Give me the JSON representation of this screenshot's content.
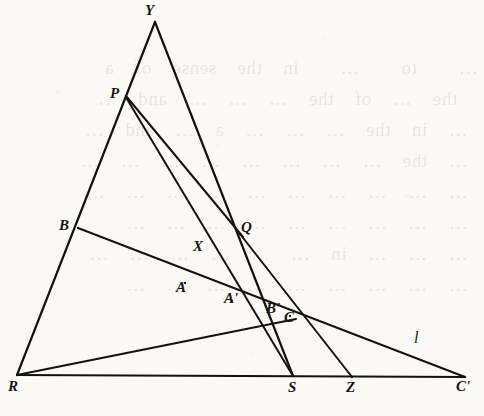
{
  "figure": {
    "ink_color": "#14120f",
    "paper_color": "#fbfaf7",
    "bleed_text": "…    to    …    in  the  sense  of  a\n  the  …  of  the  …  …  …  and  …\n …  in  the  …  …  …  a  …  and  …\n …  the  …  …  …  …  …  …  …  …\n …  …  …  …  …  …  …  …  …  …\n …  …  …  …  …  …  …  …  …\n …  …  …  in  …  …  …  …  …  …\n …  …  …  …  …  …  …  …  …",
    "points": {
      "Y": {
        "label": "Y",
        "x": 155,
        "y": 22
      },
      "P": {
        "label": "P",
        "x": 126,
        "y": 96
      },
      "B": {
        "label": "B",
        "x": 78,
        "y": 228
      },
      "Q": {
        "label": "Q",
        "x": 240,
        "y": 234
      },
      "X": {
        "label": "X",
        "x": 196,
        "y": 254
      },
      "A": {
        "label": "A",
        "x": 185,
        "y": 283
      },
      "Aprime": {
        "label": "A'",
        "x": 232,
        "y": 301
      },
      "Bprime": {
        "label": "B'",
        "x": 273,
        "y": 312
      },
      "C": {
        "label": "C",
        "x": 290,
        "y": 316
      },
      "R": {
        "label": "R",
        "x": 17,
        "y": 375
      },
      "S": {
        "label": "S",
        "x": 293,
        "y": 376
      },
      "Z": {
        "label": "Z",
        "x": 352,
        "y": 377
      },
      "Cprime": {
        "label": "C'",
        "x": 465,
        "y": 377
      },
      "l": {
        "label": "l",
        "x": 416,
        "y": 340
      }
    },
    "labels": [
      {
        "name": "label-Y",
        "text": "Y",
        "x": 145,
        "y": 2,
        "style": "italic"
      },
      {
        "name": "label-P",
        "text": "P",
        "x": 110,
        "y": 85,
        "style": "italic"
      },
      {
        "name": "label-B",
        "text": "B",
        "x": 59,
        "y": 217,
        "style": "italic"
      },
      {
        "name": "label-Q",
        "text": "Q",
        "x": 241,
        "y": 219,
        "style": "italic"
      },
      {
        "name": "label-X",
        "text": "X",
        "x": 193,
        "y": 238,
        "style": "italic"
      },
      {
        "name": "label-A",
        "text": "A",
        "x": 176,
        "y": 279,
        "style": "italic"
      },
      {
        "name": "label-A-prime",
        "text": "A'",
        "x": 224,
        "y": 290,
        "style": "italic"
      },
      {
        "name": "label-B-prime",
        "text": "B'",
        "x": 266,
        "y": 300,
        "style": "italic"
      },
      {
        "name": "label-C",
        "text": "C",
        "x": 284,
        "y": 309,
        "style": "italic"
      },
      {
        "name": "label-l",
        "text": "l",
        "x": 414,
        "y": 329,
        "style": "italic-light"
      },
      {
        "name": "label-R",
        "text": "R",
        "x": 8,
        "y": 378,
        "style": "italic"
      },
      {
        "name": "label-S",
        "text": "S",
        "x": 288,
        "y": 379,
        "style": "italic"
      },
      {
        "name": "label-Z",
        "text": "Z",
        "x": 346,
        "y": 379,
        "style": "italic"
      },
      {
        "name": "label-C-prime",
        "text": "C'",
        "x": 456,
        "y": 378,
        "style": "italic"
      }
    ],
    "segments": [
      {
        "name": "line-R-to-Y",
        "from": "R",
        "to": "Y",
        "d": "M 17 375 L 155 22",
        "width": 2.2
      },
      {
        "name": "line-Y-to-S",
        "from": "Y",
        "to": "S",
        "d": "M 155 22 L 293 376",
        "width": 2.2
      },
      {
        "name": "line-R-to-Cprime",
        "from": "R",
        "to": "C'",
        "d": "M 17 375 L 465 377",
        "width": 2.2
      },
      {
        "name": "line-P-to-Q",
        "from": "P",
        "to": "Q",
        "d": "M 126 96 L 243 237",
        "width": 2.0
      },
      {
        "name": "line-P-to-S",
        "from": "P",
        "to": "S",
        "d": "M 127 99 L 293 376",
        "width": 2.0
      },
      {
        "name": "line-R-to-Q-to-C",
        "from": "R",
        "to": "C",
        "d": "M 17 375 L 296 319",
        "width": 2.0
      },
      {
        "name": "line-B-to-Cprime",
        "from": "B",
        "to": "C'",
        "d": "M 78 228 L 465 377",
        "width": 2.0
      },
      {
        "name": "line-Q-to-Z",
        "from": "Q",
        "to": "Z",
        "d": "M 240 234 L 352 377",
        "width": 2.0
      }
    ]
  }
}
